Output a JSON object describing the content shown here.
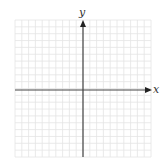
{
  "diagram": {
    "type": "coordinate-plane",
    "x_axis_label": "x",
    "y_axis_label": "y",
    "grid_cells_x": 20,
    "grid_cells_y": 20,
    "colors": {
      "grid": "#e4e4e4",
      "axis": "#444444",
      "label": "#333333"
    }
  }
}
